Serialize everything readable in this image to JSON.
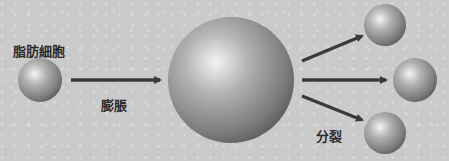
{
  "diagram": {
    "labels": {
      "fat_cell": "脂肪細胞",
      "expansion": "膨脹",
      "division": "分裂"
    },
    "nodes": [
      {
        "id": "fat-cell",
        "cx": 40,
        "cy": 80,
        "r": 22
      },
      {
        "id": "expanded-cell",
        "cx": 231,
        "cy": 80,
        "r": 63
      },
      {
        "id": "daughter-cell-top",
        "cx": 385,
        "cy": 27,
        "r": 21
      },
      {
        "id": "daughter-cell-middle",
        "cx": 416,
        "cy": 80,
        "r": 22
      },
      {
        "id": "daughter-cell-bottom",
        "cx": 385,
        "cy": 132,
        "r": 21
      }
    ],
    "edges": [
      {
        "from": "fat-cell",
        "to": "expanded-cell",
        "label": "膨脹"
      },
      {
        "from": "expanded-cell",
        "to": "daughter-cell-top",
        "label": "分裂"
      },
      {
        "from": "expanded-cell",
        "to": "daughter-cell-middle",
        "label": "分裂"
      },
      {
        "from": "expanded-cell",
        "to": "daughter-cell-bottom",
        "label": "分裂"
      }
    ],
    "colors": {
      "background": "#cacaca",
      "arrow": "#3a3a3a",
      "sphere_light": "#f2f2f2",
      "sphere_dark": "#5e5e5e",
      "text": "#2a2a2a"
    }
  }
}
